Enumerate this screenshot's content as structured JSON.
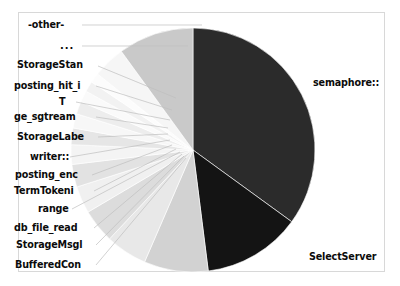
{
  "figure": {
    "background": "#ffffff",
    "frame_color": "#d8d8d8",
    "leader_line_color": "#bfbfbf",
    "label_color": "#0b0b0b"
  },
  "chart_data": {
    "type": "pie",
    "title": "",
    "center": {
      "x": 193,
      "y": 150
    },
    "radius": 122,
    "start_angle_deg": -90,
    "direction": "clockwise",
    "legend": "none",
    "grid": false,
    "labels": [
      "semaphore::",
      "SelectServer",
      "BufferedCon",
      "StorageMsgl",
      "db_file_read",
      "range",
      "TermTokeni",
      "posting_enc",
      "writer::",
      "StorageLabe",
      "ge_sgtream",
      "T",
      "posting_hit_i",
      "StorageStan",
      "...",
      "-other-"
    ],
    "values": [
      35.0,
      13.0,
      8.5,
      5.5,
      4.5,
      3.6,
      3.0,
      2.6,
      2.2,
      1.9,
      1.7,
      1.5,
      1.4,
      1.3,
      4.3,
      10.0
    ],
    "colors": [
      "#2b2b2b",
      "#141414",
      "#d2d2d2",
      "#e8e8e8",
      "#dcdcdc",
      "#f0f0f0",
      "#e2e2e2",
      "#f4f4f4",
      "#e6e6e6",
      "#f7f7f7",
      "#ededed",
      "#fafafa",
      "#f2f2f2",
      "#fcfcfc",
      "#f6f6f6",
      "#c9c9c9"
    ],
    "xlabel": "",
    "ylabel": ""
  },
  "labels_left": [
    {
      "text": "-other-",
      "x": 28,
      "y": 28
    },
    {
      "text": "...",
      "x": 60,
      "y": 49
    },
    {
      "text": "StorageStan",
      "x": 17,
      "y": 68
    },
    {
      "text": "posting_hit_i",
      "x": 14,
      "y": 89
    },
    {
      "text": "T",
      "x": 59,
      "y": 105
    },
    {
      "text": "ge_sgtream",
      "x": 14,
      "y": 120
    },
    {
      "text": "StorageLabe",
      "x": 17,
      "y": 140
    },
    {
      "text": "writer::",
      "x": 30,
      "y": 160
    },
    {
      "text": "posting_enc",
      "x": 15,
      "y": 178
    },
    {
      "text": "TermTokeni",
      "x": 14,
      "y": 194
    },
    {
      "text": "range",
      "x": 38,
      "y": 212
    },
    {
      "text": "db_file_read",
      "x": 14,
      "y": 231
    },
    {
      "text": "StorageMsgl",
      "x": 16,
      "y": 248
    },
    {
      "text": "BufferedCon",
      "x": 15,
      "y": 268
    }
  ],
  "labels_right": [
    {
      "text": "semaphore::",
      "x": 313,
      "y": 86
    },
    {
      "text": "SelectServer",
      "x": 309,
      "y": 260
    }
  ],
  "leader_lines": [
    {
      "x1": 82,
      "y1": 25,
      "x2": 202,
      "y2": 25
    },
    {
      "x1": 82,
      "y1": 46,
      "x2": 188,
      "y2": 46
    },
    {
      "x1": 98,
      "y1": 66,
      "x2": 176,
      "y2": 98
    },
    {
      "x1": 96,
      "y1": 86,
      "x2": 172,
      "y2": 110
    },
    {
      "x1": 76,
      "y1": 102,
      "x2": 170,
      "y2": 120
    },
    {
      "x1": 96,
      "y1": 117,
      "x2": 168,
      "y2": 128
    },
    {
      "x1": 98,
      "y1": 137,
      "x2": 168,
      "y2": 134
    },
    {
      "x1": 70,
      "y1": 157,
      "x2": 170,
      "y2": 140
    },
    {
      "x1": 92,
      "y1": 175,
      "x2": 172,
      "y2": 145
    },
    {
      "x1": 94,
      "y1": 191,
      "x2": 176,
      "y2": 149
    },
    {
      "x1": 72,
      "y1": 209,
      "x2": 180,
      "y2": 152
    },
    {
      "x1": 94,
      "y1": 228,
      "x2": 182,
      "y2": 154
    },
    {
      "x1": 96,
      "y1": 245,
      "x2": 184,
      "y2": 156
    },
    {
      "x1": 96,
      "y1": 265,
      "x2": 186,
      "y2": 158
    }
  ]
}
